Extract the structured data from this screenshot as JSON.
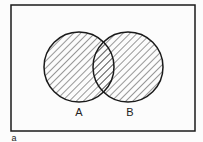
{
  "diagram": {
    "type": "venn",
    "universe": {
      "x": 11,
      "y": 5,
      "width": 184,
      "height": 126
    },
    "sets": [
      {
        "label": "A",
        "cx": 79,
        "cy": 67,
        "r": 35,
        "label_x": 79,
        "label_y": 116
      },
      {
        "label": "B",
        "cx": 128,
        "cy": 67,
        "r": 35,
        "label_x": 130,
        "label_y": 116
      }
    ],
    "shaded_region": "A ∪ B",
    "hatch": "diagonal",
    "caption": "a",
    "colors": {
      "stroke": "#1a1a1a",
      "hatch": "#333333",
      "background": "#fcfcfc"
    }
  }
}
